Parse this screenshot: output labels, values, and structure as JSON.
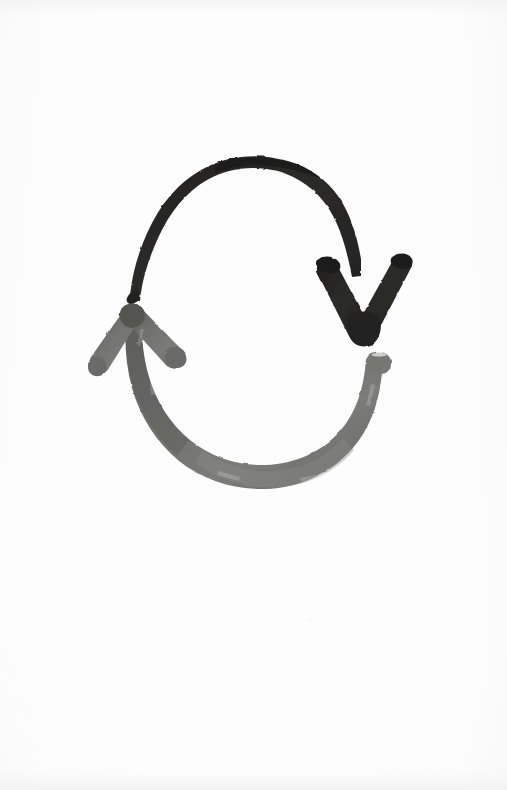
{
  "document": {
    "kind": "scanned-hand-drawing",
    "medium": "brush-marker-on-paper",
    "background_color": "#fdfdfd",
    "width": 507,
    "height": 790,
    "title": "Two-arrow cycle sketch"
  },
  "palette": {
    "paper": "#fdfdfd",
    "paper_shade": "#f2f2f3",
    "ink_dark": "#2b2a28",
    "ink_dark_edge": "#1d1c1b",
    "ink_gray": "#6d6d6a",
    "ink_gray_dark": "#4d4d4b",
    "ink_gray_light": "#8a8a87"
  },
  "figure": {
    "name": "cycle-arrows",
    "stroke_count": 2,
    "bounding_box": {
      "x": 82,
      "y": 155,
      "width": 333,
      "height": 335
    },
    "strokes": [
      {
        "id": "upper-arrow",
        "label": "Upper clockwise arrow",
        "color": "#2b2a28",
        "tone": "black",
        "direction": "clockwise",
        "start_point": {
          "x": 128,
          "y": 301
        },
        "end_point": {
          "x": 363,
          "y": 341
        },
        "arrowhead": "down-pointing-chevron",
        "arrowhead_position": {
          "x": 363,
          "y": 300
        },
        "thickness_px": 15
      },
      {
        "id": "lower-arrow",
        "label": "Lower counter-clockwise arrow",
        "color": "#6d6d6a",
        "tone": "gray",
        "direction": "clockwise-returning",
        "start_point": {
          "x": 385,
          "y": 358
        },
        "end_point": {
          "x": 128,
          "y": 308
        },
        "arrowhead": "up-left-pointing-chevron",
        "arrowhead_position": {
          "x": 128,
          "y": 308
        },
        "thickness_px": 16
      }
    ]
  },
  "annotations": {
    "has_text": false,
    "text_items": []
  }
}
